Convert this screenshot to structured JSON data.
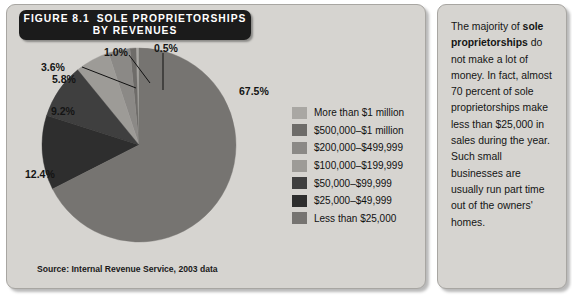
{
  "figure": {
    "number": "FIGURE 8.1",
    "title_line1": "SOLE PROPRIETORSHIPS",
    "title_line2": "BY REVENUES",
    "source": "Source: Internal Revenue Service, 2003 data"
  },
  "note": {
    "part1": "The majority of ",
    "bold": "sole proprietorships",
    "part2": " do not make a lot of money. In fact, almost 70 percent of sole proprietorships make less than $25,000 in sales during the year. Such small businesses are usually run part time out of the owners' homes."
  },
  "colors": {
    "panel_bg": "#d6d4d0",
    "banner_bg": "#1b1b1b",
    "banner_text": "#ffffff",
    "slice_more_than_1m": "#a9a7a3",
    "slice_500k_1m": "#6e6c69",
    "slice_200k_499k": "#8b8986",
    "slice_100k_199k": "#9d9b97",
    "slice_50k_99k": "#3f3f3f",
    "slice_25k_49k": "#2e2e2e",
    "slice_less_25k": "#767471"
  },
  "chart_data": {
    "type": "pie",
    "title": "SOLE PROPRIETORSHIPS BY REVENUES",
    "subtitle": "FIGURE 8.1",
    "unit": "percent",
    "legend_position": "right",
    "source": "Internal Revenue Service, 2003 data",
    "categories": [
      "More than $1 million",
      "$500,000–$1 million",
      "$200,000–$499,999",
      "$100,000–$199,999",
      "$50,000–$99,999",
      "$25,000–$49,999",
      "Less than $25,000"
    ],
    "values": [
      0.5,
      1.0,
      3.6,
      5.8,
      9.2,
      12.4,
      67.5
    ],
    "value_labels": [
      "0.5%",
      "1.0%",
      "3.6%",
      "5.8%",
      "9.2%",
      "12.4%",
      "67.5%"
    ],
    "slice_colors": [
      "#a9a7a3",
      "#6e6c69",
      "#8b8986",
      "#9d9b97",
      "#3f3f3f",
      "#2e2e2e",
      "#767471"
    ],
    "start_angle_deg": -90,
    "direction": "counterclockwise"
  },
  "legend": {
    "items": [
      {
        "label": "More than $1 million",
        "color": "#a9a7a3"
      },
      {
        "label": "$500,000–$1 million",
        "color": "#6e6c69"
      },
      {
        "label": "$200,000–$499,999",
        "color": "#8b8986"
      },
      {
        "label": "$100,000–$199,999",
        "color": "#9d9b97"
      },
      {
        "label": "$50,000–$99,999",
        "color": "#3f3f3f"
      },
      {
        "label": "$25,000–$49,999",
        "color": "#2e2e2e"
      },
      {
        "label": "Less than $25,000",
        "color": "#767471"
      }
    ]
  },
  "pct_labels": {
    "p675": "67.5%",
    "p124": "12.4%",
    "p92": "9.2%",
    "p58": "5.8%",
    "p36": "3.6%",
    "p10": "1.0%",
    "p05": "0.5%"
  }
}
